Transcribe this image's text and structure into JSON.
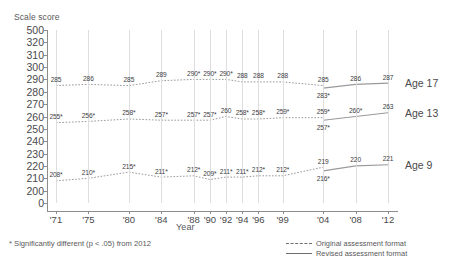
{
  "chart_data": {
    "type": "line",
    "title": "",
    "ylabel": "Scale score",
    "xlabel": "Year",
    "grid": "vertical",
    "legend_position": "bottom-right",
    "ylim": [
      0,
      500
    ],
    "y_ticks": [
      "500",
      "320",
      "310",
      "300",
      "290",
      "280",
      "270",
      "260",
      "250",
      "240",
      "230",
      "220",
      "210",
      "200",
      "0"
    ],
    "categories": [
      "'71",
      "'75",
      "'80",
      "'84",
      "'88",
      "'90",
      "'92",
      "'94",
      "'96",
      "'99",
      "'04",
      "'08",
      "'12"
    ],
    "annotation": "* Significantly different (p < .05) from 2012",
    "series": [
      {
        "name": "Age 17",
        "format_original": {
          "x": [
            "'71",
            "'75",
            "'80",
            "'84",
            "'88",
            "'90",
            "'92",
            "'94",
            "'96",
            "'99",
            "'04"
          ],
          "values": [
            285,
            286,
            285,
            289,
            290,
            290,
            290,
            288,
            288,
            288,
            285
          ],
          "labels": [
            "285",
            "286",
            "285",
            "289",
            "290*",
            "290*",
            "290*",
            "288",
            "288",
            "288",
            "285"
          ]
        },
        "format_revised": {
          "x": [
            "'04",
            "'08",
            "'12"
          ],
          "values": [
            283,
            286,
            287
          ],
          "labels": [
            "283*",
            "286",
            "287"
          ]
        }
      },
      {
        "name": "Age 13",
        "format_original": {
          "x": [
            "'71",
            "'75",
            "'80",
            "'84",
            "'88",
            "'90",
            "'92",
            "'94",
            "'96",
            "'99",
            "'04"
          ],
          "values": [
            255,
            256,
            258,
            257,
            257,
            257,
            260,
            258,
            258,
            259,
            259
          ],
          "labels": [
            "255*",
            "256*",
            "258*",
            "257*",
            "257*",
            "257*",
            "260",
            "258*",
            "258*",
            "259*",
            "259*"
          ]
        },
        "format_revised": {
          "x": [
            "'04",
            "'08",
            "'12"
          ],
          "values": [
            257,
            260,
            263
          ],
          "labels": [
            "257*",
            "260*",
            "263"
          ]
        }
      },
      {
        "name": "Age 9",
        "format_original": {
          "x": [
            "'71",
            "'75",
            "'80",
            "'84",
            "'88",
            "'90",
            "'92",
            "'94",
            "'96",
            "'99",
            "'04"
          ],
          "values": [
            208,
            210,
            215,
            211,
            212,
            209,
            211,
            211,
            212,
            212,
            219
          ],
          "labels": [
            "208*",
            "210*",
            "215*",
            "211*",
            "212*",
            "209*",
            "211*",
            "211*",
            "212*",
            "212*",
            "219"
          ]
        },
        "format_revised": {
          "x": [
            "'04",
            "'08",
            "'12"
          ],
          "values": [
            216,
            220,
            221
          ],
          "labels": [
            "216*",
            "220",
            "221"
          ]
        }
      }
    ],
    "legend": [
      {
        "label": "Original assessment format",
        "style": "dashed"
      },
      {
        "label": "Revised assessment format",
        "style": "solid"
      }
    ],
    "line_color": "#9a9a9c"
  }
}
